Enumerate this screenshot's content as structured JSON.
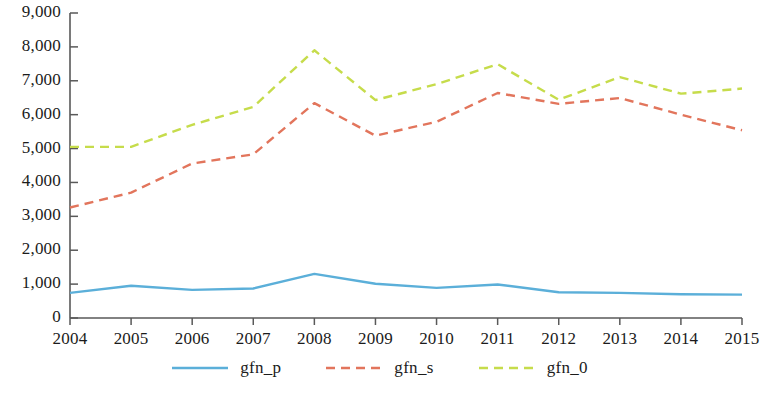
{
  "chart_data": {
    "type": "line",
    "title": "",
    "xlabel": "",
    "ylabel": "",
    "categories": [
      "2004",
      "2005",
      "2006",
      "2007",
      "2008",
      "2009",
      "2010",
      "2011",
      "2012",
      "2013",
      "2014",
      "2015"
    ],
    "ylim": [
      0,
      9000
    ],
    "ytick_step": 1000,
    "yticks": [
      "0",
      "1,000",
      "2,000",
      "3,000",
      "4,000",
      "5,000",
      "6,000",
      "7,000",
      "8,000",
      "9,000"
    ],
    "ytick_values": [
      0,
      1000,
      2000,
      3000,
      4000,
      5000,
      6000,
      7000,
      8000,
      9000
    ],
    "grid": false,
    "legend_position": "bottom",
    "series": [
      {
        "name": "gfn_p",
        "color": "#5BAFD9",
        "style": "solid",
        "values": [
          740,
          950,
          830,
          870,
          1300,
          1010,
          890,
          990,
          760,
          740,
          700,
          690
        ]
      },
      {
        "name": "gfn_s",
        "color": "#E2755C",
        "style": "dashed",
        "values": [
          3260,
          3700,
          4560,
          4830,
          6340,
          5380,
          5790,
          6640,
          6320,
          6490,
          6000,
          5540
        ]
      },
      {
        "name": "gfn_0",
        "color": "#C6DC4B",
        "style": "dashed",
        "values": [
          5050,
          5050,
          5700,
          6230,
          7900,
          6430,
          6900,
          7490,
          6440,
          7110,
          6620,
          6770
        ]
      }
    ]
  },
  "axis": {
    "line_color": "#595959"
  }
}
